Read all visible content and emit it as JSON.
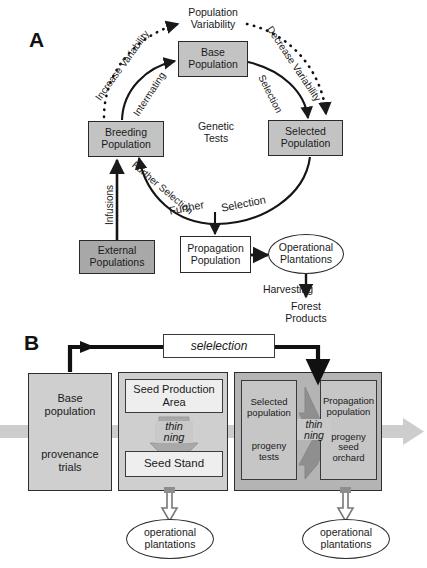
{
  "figure": {
    "panels": [
      {
        "letter": "A"
      },
      {
        "letter": "B"
      }
    ]
  },
  "panelA": {
    "letter": "A",
    "nodes": [
      {
        "id": "base",
        "label": "Base\nPopulation",
        "text1": "Base",
        "text2": "Population",
        "shape": "rect",
        "fill": "#c3c3c3"
      },
      {
        "id": "breeding",
        "label": "Breeding\nPopulation",
        "text1": "Breeding",
        "text2": "Population",
        "shape": "rect",
        "fill": "#c3c3c3"
      },
      {
        "id": "selected",
        "label": "Selected\nPopulation",
        "text1": "Selected",
        "text2": "Population",
        "shape": "rect",
        "fill": "#c3c3c3"
      },
      {
        "id": "external",
        "label": "External\nPopulations",
        "text1": "External",
        "text2": "Populations",
        "shape": "rect",
        "fill": "#a8a8a8"
      },
      {
        "id": "propagation",
        "label": "Propagation\nPopulation",
        "text1": "Propagation",
        "text2": "Population",
        "shape": "rect",
        "fill": "#ffffff"
      },
      {
        "id": "operational",
        "label": "Operational\nPlantations",
        "text1": "Operational",
        "text2": "Plantations",
        "shape": "ellipse",
        "fill": "#ffffff"
      },
      {
        "id": "forest",
        "label": "Forest\nProducts",
        "text1": "Forest",
        "text2": "Products",
        "shape": "text",
        "fill": "none"
      }
    ],
    "center_label_1": "Genetic",
    "center_label_2": "Tests",
    "top_label_1": "Population",
    "top_label_2": "Variability",
    "edges": [
      {
        "id": "increase",
        "label": "Increase Variability",
        "style": "dotted",
        "from": "breeding",
        "to": "population-variability"
      },
      {
        "id": "decrease",
        "label": "Decrease Variability",
        "style": "dotted",
        "from": "population-variability",
        "to": "selected"
      },
      {
        "id": "intermating",
        "label": "Intermating",
        "style": "solid",
        "from": "breeding",
        "to": "base"
      },
      {
        "id": "selection",
        "label": "Selection",
        "style": "solid",
        "from": "base",
        "to": "selected"
      },
      {
        "id": "further-arc",
        "label": "Further Selection",
        "style": "solid",
        "from": "selected",
        "to": "breeding"
      },
      {
        "id": "infusions",
        "label": "Infusions",
        "style": "solid",
        "from": "external",
        "to": "breeding"
      },
      {
        "id": "further-1",
        "label": "Further",
        "style": "solid",
        "from": "arc",
        "to": "propagation"
      },
      {
        "id": "further-2",
        "label": "Selection",
        "style": "solid",
        "from": "arc",
        "to": "propagation"
      },
      {
        "id": "harvesting",
        "label": "Harvesting",
        "style": "solid",
        "from": "operational",
        "to": "forest"
      }
    ]
  },
  "panelB": {
    "letter": "B",
    "selection_box": "selelection",
    "groups": [
      {
        "id": "base-group",
        "cells": [
          {
            "id": "base-population",
            "label": "Base\npopulation",
            "line1": "Base",
            "line2": "population"
          },
          {
            "id": "provenance-trials",
            "label": "provenance\ntrials",
            "line1": "provenance",
            "line2": "trials"
          }
        ]
      },
      {
        "id": "seed-group",
        "cells": [
          {
            "id": "seed-production-area",
            "label": "Seed Production\nArea",
            "line1": "Seed Production",
            "line2": "Area"
          },
          {
            "id": "seed-stand",
            "label": "Seed Stand",
            "line1": "Seed Stand",
            "line2": ""
          }
        ],
        "thinning_label_1": "thin",
        "thinning_label_2": "ning"
      },
      {
        "id": "progeny-group",
        "cells": [
          {
            "id": "selected-population",
            "label": "Selected\npopulation",
            "line1": "Selected",
            "line2": "population"
          },
          {
            "id": "progeny-tests",
            "label": "progeny\ntests",
            "line1": "progeny",
            "line2": "tests"
          },
          {
            "id": "propagation-population",
            "label": "Propagation\npopulation",
            "line1": "Propagation",
            "line2": "population"
          },
          {
            "id": "progeny-seed-orchard",
            "label": "progeny\nseed\norchard",
            "line1": "progeny",
            "line2": "seed",
            "line3": "orchard"
          }
        ],
        "thinning_label_1": "thin",
        "thinning_label_2": "ning"
      }
    ],
    "outputs": [
      {
        "id": "operational-plantations-left",
        "line1": "operational",
        "line2": "plantations"
      },
      {
        "id": "operational-plantations-right",
        "line1": "operational",
        "line2": "plantations"
      }
    ]
  },
  "colors": {
    "box_gray": "#c3c3c3",
    "box_dark_gray": "#a8a8a8",
    "box_white": "#ffffff",
    "group_light": "#cfcfcf",
    "group_mid": "#b4b4b4",
    "band_gray": "#d6d6d6",
    "stroke": "#2a2a2a",
    "background": "#ffffff"
  }
}
